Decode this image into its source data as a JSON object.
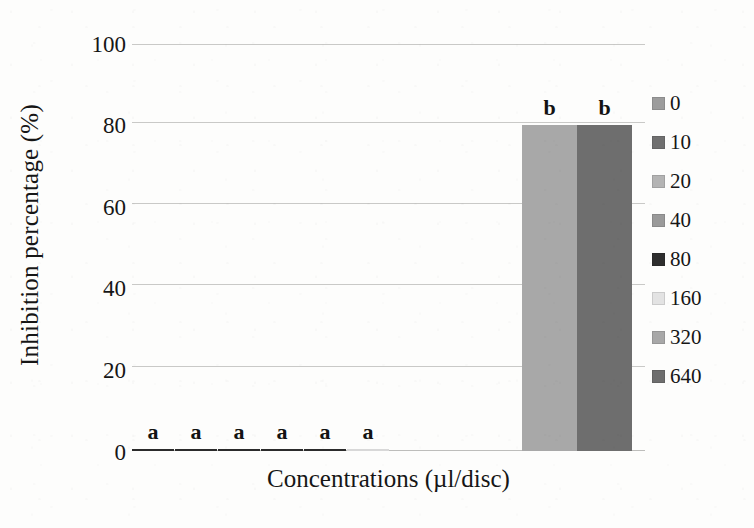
{
  "chart_data": {
    "type": "bar",
    "title": "",
    "xlabel": "Concentrations (µl/disc)",
    "ylabel": "Inhibition percentage (%)",
    "categories": [
      "0",
      "10",
      "20",
      "40",
      "80",
      "160",
      "320",
      "640"
    ],
    "values": [
      0.5,
      0.5,
      0.5,
      0.5,
      0.5,
      0.5,
      80,
      80
    ],
    "annotations": [
      "a",
      "a",
      "a",
      "a",
      "a",
      "a",
      "b",
      "b"
    ],
    "series": [
      {
        "name": "Inhibition percentage (%)",
        "values": [
          0.5,
          0.5,
          0.5,
          0.5,
          0.5,
          0.5,
          80,
          80
        ]
      }
    ],
    "ylim": [
      0,
      100
    ],
    "yticks": [
      0,
      20,
      40,
      60,
      80,
      100
    ],
    "ytick_labels": [
      "0",
      "20",
      "40",
      "60",
      "80",
      "100"
    ],
    "xtick_labels": [],
    "grid": true,
    "legend_position": "right",
    "bar_colors": [
      "#9c9c9c",
      "#707070",
      "#b4b4b4",
      "#9a9a9a",
      "#2e2e2e",
      "#e3e3e3",
      "#a8a8a8",
      "#6e6e6e"
    ]
  },
  "axes": {
    "y_title": "Inhibition percentage (%)",
    "x_title": "Concentrations (µl/disc)",
    "y_ticks": [
      {
        "label": "100",
        "value": 100
      },
      {
        "label": "80",
        "value": 80
      },
      {
        "label": "60",
        "value": 60
      },
      {
        "label": "40",
        "value": 40
      },
      {
        "label": "20",
        "value": 20
      },
      {
        "label": "0",
        "value": 0
      }
    ]
  },
  "legend": {
    "items": [
      {
        "label": "0",
        "color": "#9c9c9c"
      },
      {
        "label": "10",
        "color": "#707070"
      },
      {
        "label": "20",
        "color": "#b4b4b4"
      },
      {
        "label": "40",
        "color": "#9a9a9a"
      },
      {
        "label": "80",
        "color": "#2e2e2e"
      },
      {
        "label": "160",
        "color": "#e3e3e3"
      },
      {
        "label": "320",
        "color": "#a8a8a8"
      },
      {
        "label": "640",
        "color": "#6e6e6e"
      }
    ]
  },
  "bars": [
    {
      "label": "0",
      "value": 0.5,
      "annotation": "a",
      "color": "#2b2b2b",
      "x": 0,
      "width": 42
    },
    {
      "label": "10",
      "value": 0.5,
      "annotation": "a",
      "color": "#2b2b2b",
      "x": 43,
      "width": 42
    },
    {
      "label": "20",
      "value": 0.5,
      "annotation": "a",
      "color": "#2b2b2b",
      "x": 86,
      "width": 42
    },
    {
      "label": "40",
      "value": 0.5,
      "annotation": "a",
      "color": "#2b2b2b",
      "x": 129,
      "width": 42
    },
    {
      "label": "80",
      "value": 0.5,
      "annotation": "a",
      "color": "#2b2b2b",
      "x": 172,
      "width": 42
    },
    {
      "label": "160",
      "value": 0.5,
      "annotation": "a",
      "color": "#d8d8d8",
      "x": 215,
      "width": 42
    },
    {
      "label": "320",
      "value": 80,
      "annotation": "b",
      "color": "#a8a8a8",
      "x": 390,
      "width": 55
    },
    {
      "label": "640",
      "value": 80,
      "annotation": "b",
      "color": "#6e6e6e",
      "x": 445,
      "width": 55
    }
  ]
}
